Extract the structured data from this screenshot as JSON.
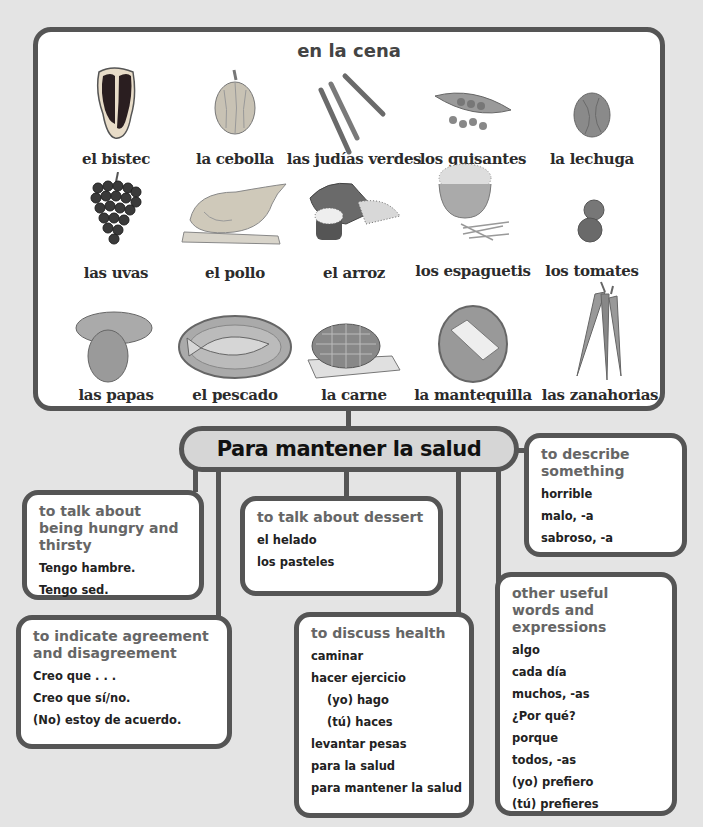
{
  "top_section": {
    "title": "en la cena",
    "foods": [
      {
        "label": "el bistec",
        "icon": "steak-icon"
      },
      {
        "label": "la cebolla",
        "icon": "onion-icon"
      },
      {
        "label": "las judías verdes",
        "icon": "green-beans-icon"
      },
      {
        "label": "los guisantes",
        "icon": "peas-icon"
      },
      {
        "label": "la lechuga",
        "icon": "lettuce-icon"
      },
      {
        "label": "las uvas",
        "icon": "grapes-icon"
      },
      {
        "label": "el pollo",
        "icon": "chicken-icon"
      },
      {
        "label": "el arroz",
        "icon": "rice-icon"
      },
      {
        "label": "los espaguetis",
        "icon": "spaghetti-icon"
      },
      {
        "label": "los tomates",
        "icon": "tomatoes-icon"
      },
      {
        "label": "las papas",
        "icon": "potatoes-icon"
      },
      {
        "label": "el pescado",
        "icon": "fish-icon"
      },
      {
        "label": "la carne",
        "icon": "meat-icon"
      },
      {
        "label": "la mantequilla",
        "icon": "butter-icon"
      },
      {
        "label": "las zanahorias",
        "icon": "carrots-icon"
      }
    ]
  },
  "central_title": "Para mantener la salud",
  "boxes": {
    "hungry": {
      "heading": "to talk about being hungry and thirsty",
      "items": [
        "Tengo hambre.",
        "Tengo sed."
      ]
    },
    "dessert": {
      "heading": "to talk about dessert",
      "items": [
        "el helado",
        "los pasteles"
      ]
    },
    "describe": {
      "heading": "to describe something",
      "items": [
        "horrible",
        "malo, -a",
        "sabroso, -a"
      ]
    },
    "agreement": {
      "heading": "to indicate agreement and disagreement",
      "items": [
        "Creo que . . .",
        "Creo que sí/no.",
        "(No) estoy de acuerdo."
      ]
    },
    "health": {
      "heading": "to discuss health",
      "items": [
        "caminar",
        "hacer ejercicio",
        "(yo) hago",
        "(tú) haces",
        "levantar pesas",
        "para la salud",
        "para mantener la salud"
      ]
    },
    "other": {
      "heading": "other useful words and expressions",
      "items": [
        "algo",
        "cada día",
        "muchos, -as",
        "¿Por qué?",
        "porque",
        "todos, -as",
        "(yo) prefiero",
        "(tú) prefieres"
      ]
    }
  },
  "colors": {
    "border": "#555555",
    "background": "#e4e4e4",
    "pill": "#d6d6d6",
    "heading_text": "#666666"
  }
}
